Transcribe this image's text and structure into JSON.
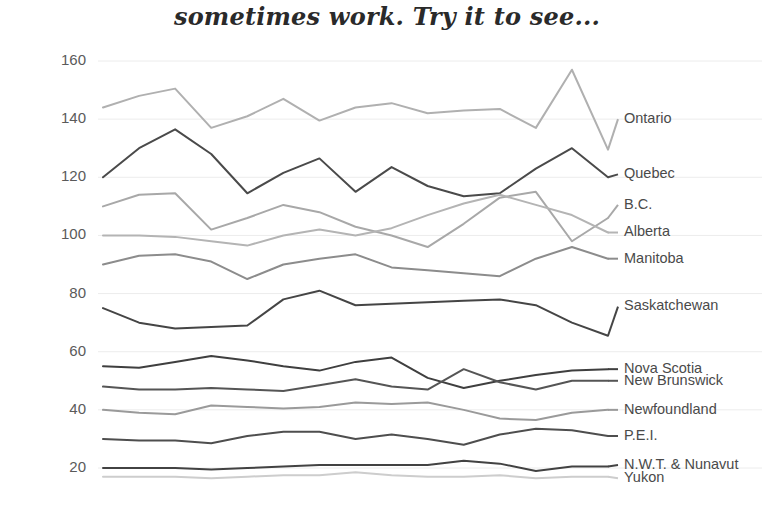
{
  "chart_data": {
    "type": "line",
    "title": "sometimes work. Try it to see...",
    "xlabel": "",
    "ylabel": "",
    "ylim": [
      10,
      165
    ],
    "yticks": [
      20,
      40,
      60,
      80,
      100,
      120,
      140,
      160
    ],
    "grid": true,
    "legend_position": "right-inline-end-of-line",
    "x": [
      1,
      2,
      3,
      4,
      5,
      6,
      7,
      8,
      9,
      10,
      11,
      12,
      13,
      14,
      15
    ],
    "series": [
      {
        "name": "Ontario",
        "color": "#b0b0b0",
        "values": [
          144,
          148,
          150.5,
          137,
          141,
          147,
          139.5,
          144,
          145.5,
          142,
          143,
          143.5,
          137,
          157,
          129.5
        ]
      },
      {
        "name": "Quebec",
        "color": "#4a4a4a",
        "values": [
          120,
          130,
          136.5,
          128,
          114.5,
          121.5,
          126.5,
          115,
          123.5,
          117,
          113.5,
          114.5,
          123,
          130,
          120
        ]
      },
      {
        "name": "B.C.",
        "color": "#a8a8a8",
        "values": [
          110,
          114,
          114.5,
          102,
          106,
          110.5,
          108,
          103,
          100,
          96,
          104,
          113,
          115,
          98,
          106
        ]
      },
      {
        "name": "Alberta",
        "color": "#b4b4b4",
        "values": [
          100,
          100,
          99.5,
          98,
          96.5,
          100,
          102,
          100,
          102.5,
          107,
          111,
          114,
          110.5,
          107,
          101
        ]
      },
      {
        "name": "Manitoba",
        "color": "#8c8c8c",
        "values": [
          90,
          93,
          93.5,
          91,
          85,
          90,
          92,
          93.5,
          89,
          88,
          87,
          86,
          92,
          96,
          92
        ]
      },
      {
        "name": "Saskatchewan",
        "color": "#454545",
        "values": [
          75,
          70,
          68,
          68.5,
          69,
          78,
          81,
          76,
          76.5,
          77,
          77.5,
          78,
          76,
          70,
          65.5
        ]
      },
      {
        "name": "Nova Scotia",
        "color": "#3f3f3f",
        "values": [
          55,
          54.5,
          56.5,
          58.5,
          57,
          55,
          53.5,
          56.5,
          58,
          51,
          47.5,
          50,
          52,
          53.5,
          54
        ]
      },
      {
        "name": "New Brunswick",
        "color": "#555555",
        "values": [
          48,
          47,
          47,
          47.5,
          47,
          46.5,
          48.5,
          50.5,
          48,
          47,
          54,
          49.5,
          47,
          50,
          50
        ]
      },
      {
        "name": "Newfoundland",
        "color": "#9a9a9a",
        "values": [
          40,
          39,
          38.5,
          41.5,
          41,
          40.5,
          41,
          42.5,
          42,
          42.5,
          40,
          37,
          36.5,
          39,
          40
        ]
      },
      {
        "name": "P.E.I.",
        "color": "#4e4e4e",
        "values": [
          30,
          29.5,
          29.5,
          28.5,
          31,
          32.5,
          32.5,
          30,
          31.5,
          30,
          28,
          31.5,
          33.5,
          33,
          31
        ]
      },
      {
        "name": "N.W.T. & Nunavut",
        "color": "#424242",
        "values": [
          20,
          20,
          20,
          19.5,
          20,
          20.5,
          21,
          21,
          21,
          21,
          22.5,
          21.5,
          19,
          20.5,
          20.5
        ]
      },
      {
        "name": "Yukon",
        "color": "#cdcdcd",
        "values": [
          17,
          17,
          17,
          16.5,
          17,
          17.5,
          17.5,
          18.5,
          17.5,
          17,
          17,
          17.5,
          16.5,
          17,
          17
        ]
      }
    ],
    "legend_y_values": [
      140,
      121,
      110.5,
      101,
      92,
      75.5,
      54,
      50,
      40,
      31,
      21,
      16.5
    ]
  },
  "axis": {
    "ytick_labels": [
      "160",
      "140",
      "120",
      "100",
      "80",
      "60",
      "40",
      "20"
    ]
  }
}
